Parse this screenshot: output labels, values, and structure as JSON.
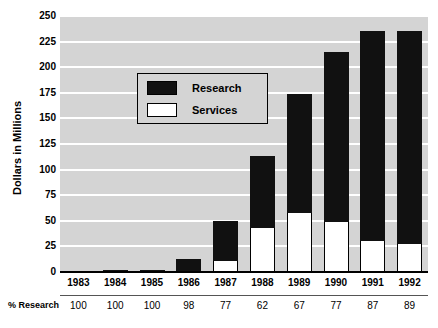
{
  "chart_data": {
    "type": "bar",
    "stacked": true,
    "title": "",
    "xlabel": "",
    "ylabel": "Dollars in Millions",
    "ylim": [
      0,
      250
    ],
    "ytick_step": 25,
    "yticks": [
      0,
      25,
      50,
      75,
      100,
      125,
      150,
      175,
      200,
      225,
      250
    ],
    "grid": true,
    "grid_color": "#ffffff",
    "plot_background": "#d4d4d4",
    "legend_position": "upper-left-inside",
    "categories": [
      "1983",
      "1984",
      "1985",
      "1986",
      "1987",
      "1988",
      "1989",
      "1990",
      "1991",
      "1992"
    ],
    "series": [
      {
        "name": "Research",
        "color": "#111111",
        "values": [
          1,
          2,
          2,
          13,
          39,
          70,
          116,
          166,
          205,
          208
        ]
      },
      {
        "name": "Services",
        "color": "#ffffff",
        "values": [
          0,
          0,
          0,
          0,
          11,
          43,
          58,
          49,
          30,
          27
        ]
      }
    ],
    "totals": [
      1,
      2,
      2,
      13,
      50,
      113,
      174,
      215,
      235,
      235
    ],
    "annotation_row": {
      "label": "% Research",
      "values": [
        "100",
        "100",
        "100",
        "98",
        "77",
        "62",
        "67",
        "77",
        "87",
        "89"
      ]
    }
  },
  "legend": {
    "items": [
      {
        "label": "Research",
        "swatch": "dark-swatch"
      },
      {
        "label": "Services",
        "swatch": "light-swatch"
      }
    ]
  }
}
